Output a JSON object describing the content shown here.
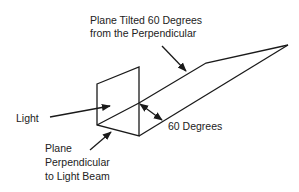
{
  "diagram": {
    "title_label": [
      "Plane Tilted 60 Degrees",
      "from the Perpendicular"
    ],
    "light_label": "Light",
    "perpendicular_label": [
      "Plane",
      "Perpendicular",
      "to Light Beam"
    ],
    "angle_label": "60 Degrees",
    "angle_degrees": 60,
    "line_color": "#1a1a1a",
    "text_color": "#222222",
    "background": "#ffffff"
  }
}
